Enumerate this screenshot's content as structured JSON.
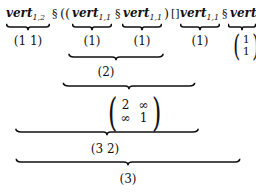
{
  "expression": {
    "terms": [
      {
        "name": "vert",
        "sub": "1,2"
      },
      {
        "name": "vert",
        "sub": "1,1"
      },
      {
        "name": "vert",
        "sub": "1,1"
      },
      {
        "name": "vert",
        "sub": "1,1"
      },
      {
        "name": "vert",
        "sub": "2,1"
      }
    ],
    "operators": {
      "seq": "§",
      "open_parens": "((",
      "close_paren": ")",
      "choice": "[]"
    }
  },
  "values": {
    "t1": "(1 1)",
    "t2": "(1)",
    "t3": "(1)",
    "t4": "(1)",
    "t5_col": [
      "1",
      "1"
    ],
    "level2": "(2)",
    "level3_matrix": [
      [
        "2",
        "∞"
      ],
      [
        "∞",
        "1"
      ]
    ],
    "level4": "(3 2)",
    "level5": "(3)"
  }
}
